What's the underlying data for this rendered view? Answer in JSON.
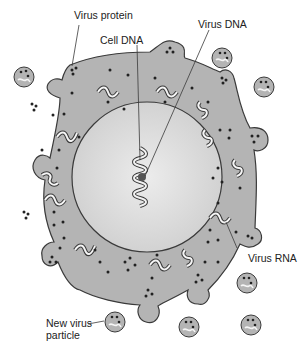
{
  "diagram": {
    "type": "virus replication in host cell",
    "labels": {
      "virus_protein": "Virus protein",
      "virus_dna": "Virus DNA",
      "cell_dna": "Cell DNA",
      "virus_rna": "Virus RNA",
      "new_virus_particle_line1": "New virus",
      "new_virus_particle_line2": "particle"
    },
    "colors": {
      "cytoplasm": "#b4b4b4",
      "nucleus": "#dcdcdc",
      "outline": "#3a3a3a",
      "dots": "#222222",
      "background": "#ffffff"
    }
  }
}
